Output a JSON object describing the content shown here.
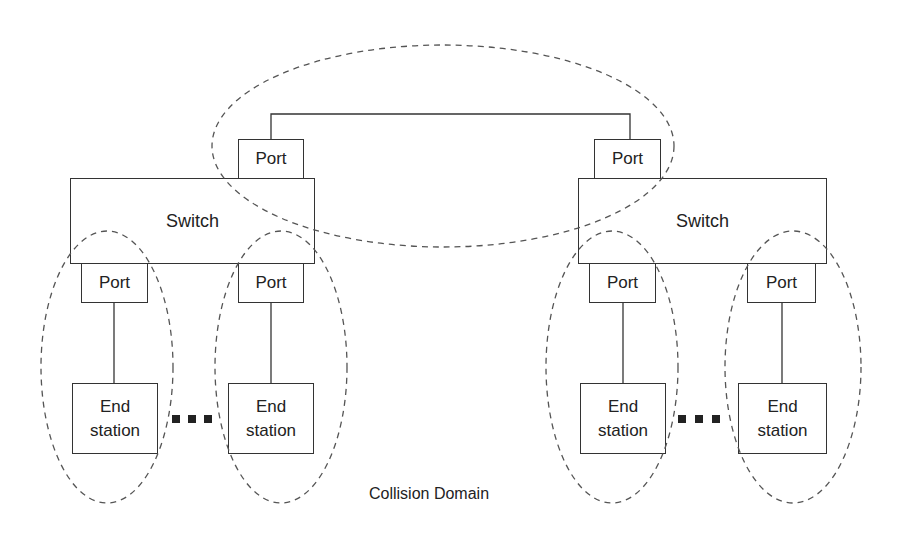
{
  "diagram": {
    "type": "network-topology",
    "title": "",
    "switches": [
      {
        "id": "switch-left",
        "label": "Switch"
      },
      {
        "id": "switch-right",
        "label": "Switch"
      }
    ],
    "uplink_ports": [
      {
        "id": "port-uplink-left",
        "label": "Port",
        "switch": "switch-left"
      },
      {
        "id": "port-uplink-right",
        "label": "Port",
        "switch": "switch-right"
      }
    ],
    "access_ports": [
      {
        "id": "port-l1",
        "label": "Port",
        "switch": "switch-left"
      },
      {
        "id": "port-l2",
        "label": "Port",
        "switch": "switch-left"
      },
      {
        "id": "port-r1",
        "label": "Port",
        "switch": "switch-right"
      },
      {
        "id": "port-r2",
        "label": "Port",
        "switch": "switch-right"
      }
    ],
    "end_stations": [
      {
        "id": "station-l1",
        "line1": "End",
        "line2": "station",
        "port": "port-l1"
      },
      {
        "id": "station-l2",
        "line1": "End",
        "line2": "station",
        "port": "port-l2"
      },
      {
        "id": "station-r1",
        "line1": "End",
        "line2": "station",
        "port": "port-r1"
      },
      {
        "id": "station-r2",
        "line1": "End",
        "line2": "station",
        "port": "port-r2"
      }
    ],
    "links": [
      {
        "from": "port-uplink-left",
        "to": "port-uplink-right"
      },
      {
        "from": "port-l1",
        "to": "station-l1"
      },
      {
        "from": "port-l2",
        "to": "station-l2"
      },
      {
        "from": "port-r1",
        "to": "station-r1"
      },
      {
        "from": "port-r2",
        "to": "station-r2"
      }
    ],
    "ellipsis_markers": [
      "between station-l1 and station-l2",
      "between station-r1 and station-r2"
    ],
    "collision_domains": 5,
    "caption": "Collision Domain",
    "colors": {
      "line": "#333333",
      "dashed": "#555555",
      "background": "#ffffff"
    }
  }
}
